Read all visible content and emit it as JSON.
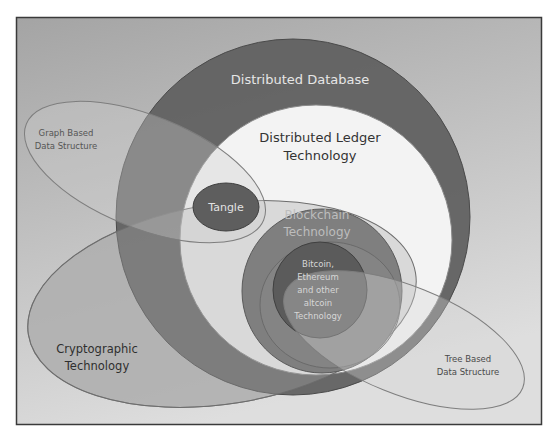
{
  "diagram": {
    "type": "venn-nested",
    "colors": {
      "background_gradient_top": "#a6a6a6",
      "background_gradient_bottom": "#dcdcdc",
      "frame": "#3a3a3a",
      "distributed_database": "#5f5f5f",
      "distributed_ledger": "#f4f4f4",
      "tangle": "#5c5c5c",
      "blockchain": "#7d7d7d",
      "altcoin": "#5a5a5a",
      "graph_ellipse": "#bcbcbc",
      "crypto_ellipse": "#b2b2b2",
      "tree_ellipse": "#cfcfcf",
      "light_text": "#e8e8e8",
      "dark_text": "#3c3c3c"
    },
    "sets": {
      "distributed_database": {
        "label": "Distributed Database"
      },
      "distributed_ledger": {
        "label_line1": "Distributed Ledger",
        "label_line2": "Technology"
      },
      "tangle": {
        "label": "Tangle"
      },
      "blockchain": {
        "label_line1": "Blockchain",
        "label_line2": "Technology"
      },
      "altcoin": {
        "label_line1": "Bitcoin,",
        "label_line2": "Ethereum",
        "label_line3": "and other",
        "label_line4": "altcoin",
        "label_line5": "Technology"
      },
      "graph_based": {
        "label_line1": "Graph Based",
        "label_line2": "Data Structure"
      },
      "cryptographic": {
        "label_line1": "Cryptographic",
        "label_line2": "Technology"
      },
      "tree_based": {
        "label_line1": "Tree Based",
        "label_line2": "Data Structure"
      }
    }
  }
}
